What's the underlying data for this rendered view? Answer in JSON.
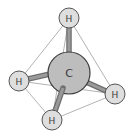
{
  "diagram": {
    "colors": {
      "background": "#ffffff",
      "atom_fill": "#c8c8c8",
      "hydrogen_fill": "#dcdcdc",
      "atom_stroke": "#444444",
      "bond": "#8a8a8a",
      "edge": "#9a9a9a"
    },
    "center_atom": {
      "label": "C",
      "x": 69,
      "y": 73,
      "r": 21
    },
    "hydrogens": [
      {
        "id": "top",
        "label": "H",
        "x": 69,
        "y": 18,
        "r": 10
      },
      {
        "id": "left",
        "label": "H",
        "x": 19,
        "y": 81,
        "r": 10
      },
      {
        "id": "bottom",
        "label": "H",
        "x": 52,
        "y": 120,
        "r": 10
      },
      {
        "id": "right",
        "label": "H",
        "x": 115,
        "y": 94,
        "r": 10
      }
    ],
    "tetrahedron_edges": [
      [
        "top",
        "left"
      ],
      [
        "top",
        "right"
      ],
      [
        "top",
        "bottom"
      ],
      [
        "left",
        "bottom"
      ],
      [
        "bottom",
        "right"
      ],
      [
        "left",
        "right"
      ]
    ]
  }
}
